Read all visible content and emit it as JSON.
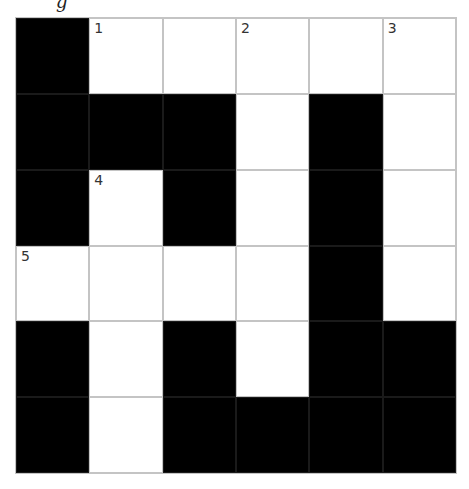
{
  "top_fragment": "g",
  "grid": {
    "rows": 6,
    "cols": 6,
    "cells": [
      [
        {
          "type": "black"
        },
        {
          "type": "white",
          "num": "1"
        },
        {
          "type": "white"
        },
        {
          "type": "white",
          "num": "2"
        },
        {
          "type": "white"
        },
        {
          "type": "white",
          "num": "3"
        }
      ],
      [
        {
          "type": "black"
        },
        {
          "type": "black"
        },
        {
          "type": "black"
        },
        {
          "type": "white"
        },
        {
          "type": "black"
        },
        {
          "type": "white"
        }
      ],
      [
        {
          "type": "black"
        },
        {
          "type": "white",
          "num": "4"
        },
        {
          "type": "black"
        },
        {
          "type": "white"
        },
        {
          "type": "black"
        },
        {
          "type": "white"
        }
      ],
      [
        {
          "type": "white",
          "num": "5"
        },
        {
          "type": "white"
        },
        {
          "type": "white"
        },
        {
          "type": "white"
        },
        {
          "type": "black"
        },
        {
          "type": "white"
        }
      ],
      [
        {
          "type": "black"
        },
        {
          "type": "white"
        },
        {
          "type": "black"
        },
        {
          "type": "white"
        },
        {
          "type": "black"
        },
        {
          "type": "black"
        }
      ],
      [
        {
          "type": "black"
        },
        {
          "type": "white"
        },
        {
          "type": "black"
        },
        {
          "type": "black"
        },
        {
          "type": "black"
        },
        {
          "type": "black"
        }
      ]
    ]
  },
  "colors": {
    "black_cell": "#000000",
    "white_cell": "#ffffff",
    "grid_line": "#c4c4c4",
    "number_text": "#333333"
  }
}
